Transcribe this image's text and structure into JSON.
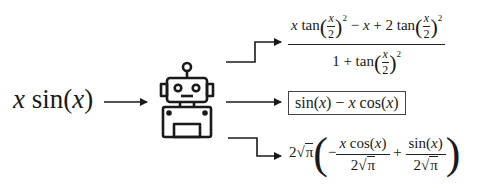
{
  "diagram": {
    "input": {
      "prefix": "x",
      "func": " sin(",
      "arg": "x",
      "close": ")"
    },
    "model_icon": "robot-icon",
    "outputs": [
      {
        "id": "top",
        "label": "x tan(x/2)^2 − x + 2 tan(x/2)^2 / (1 + tan(x/2)^2)",
        "numerator": {
          "t1_var": "x",
          "t1": " tan",
          "minus": " − ",
          "t2_var": "x",
          "plus": " + 2 tan"
        },
        "denominator": {
          "lead": "1 + tan"
        },
        "half": {
          "num": "x",
          "den": "2"
        },
        "exp": "2"
      },
      {
        "id": "middle",
        "label": "sin(x) − x cos(x)",
        "boxed": true,
        "parts": {
          "a": "sin(",
          "a_var": "x",
          "b": ") − ",
          "b_var": "x",
          "c": " cos(",
          "c_var": "x",
          "d": ")"
        }
      },
      {
        "id": "bottom",
        "label": "2√π(−x cos(x)/(2√π) + sin(x)/(2√π))",
        "coef": "2",
        "pi": "π",
        "minus": "−",
        "frac1": {
          "num_var": "x",
          "num": " cos(",
          "num_var2": "x",
          "num_end": ")",
          "den": "2"
        },
        "plus": "+",
        "frac2": {
          "num": "sin(",
          "num_var": "x",
          "num_end": ")",
          "den": "2"
        }
      }
    ],
    "colors": {
      "ink": "#1a1a1a",
      "box_border": "#444444",
      "background": "#ffffff"
    }
  }
}
